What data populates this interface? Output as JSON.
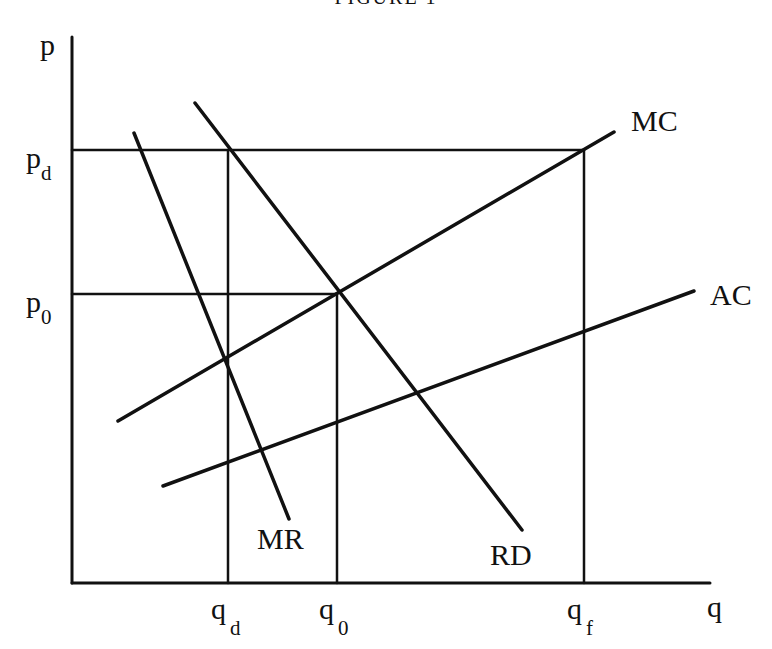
{
  "title": "FIGURE 1",
  "axes": {
    "y_label": "p",
    "x_label": "q"
  },
  "price_levels": [
    {
      "id": "pd",
      "base": "p",
      "sub": "d"
    },
    {
      "id": "p0",
      "base": "p",
      "sub": "0"
    }
  ],
  "quantity_levels": [
    {
      "id": "qd",
      "base": "q",
      "sub": "d"
    },
    {
      "id": "q0",
      "base": "q",
      "sub": "0"
    },
    {
      "id": "qf",
      "base": "q",
      "sub": "f"
    }
  ],
  "curves": [
    {
      "id": "MC",
      "label": "MC",
      "description": "Marginal cost, upward sloping"
    },
    {
      "id": "AC",
      "label": "AC",
      "description": "Average cost, upward sloping, below MC"
    },
    {
      "id": "MR",
      "label": "MR",
      "description": "Marginal revenue, steep downward sloping"
    },
    {
      "id": "RD",
      "label": "RD",
      "description": "Residual demand, downward sloping"
    }
  ],
  "colors": {
    "ink": "#111111",
    "background": "#ffffff"
  }
}
